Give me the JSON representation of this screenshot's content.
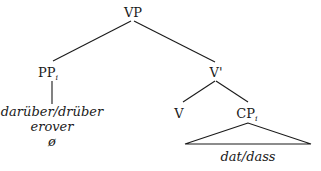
{
  "tree": {
    "root": {
      "label": "VP"
    },
    "pp": {
      "label": "PP",
      "index": "i"
    },
    "vbar": {
      "label": "V'"
    },
    "v": {
      "label": "V"
    },
    "cp": {
      "label": "CP",
      "index": "i"
    },
    "pp_terminals": [
      "darüber/drüber",
      "erover",
      "ø"
    ],
    "cp_terminal": "dat/dass"
  }
}
